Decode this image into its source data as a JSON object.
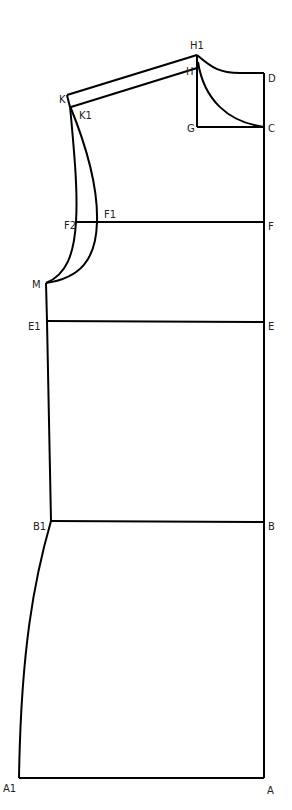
{
  "diagram": {
    "type": "sewing-pattern-draft",
    "stroke_color": "#000000",
    "label_color": "#222222",
    "background": "#ffffff",
    "points": {
      "H1": {
        "label": "H1",
        "x": 197,
        "y": 55
      },
      "H": {
        "label": "H",
        "x": 197,
        "y": 70
      },
      "D": {
        "label": "D",
        "x": 264,
        "y": 73
      },
      "G": {
        "label": "G",
        "x": 197,
        "y": 127
      },
      "C": {
        "label": "C",
        "x": 264,
        "y": 127
      },
      "K": {
        "label": "K",
        "x": 67,
        "y": 95
      },
      "K1": {
        "label": "K1",
        "x": 71,
        "y": 107
      },
      "F2": {
        "label": "F2",
        "x": 75,
        "y": 222
      },
      "F1": {
        "label": "F1",
        "x": 98,
        "y": 222
      },
      "F": {
        "label": "F",
        "x": 264,
        "y": 222
      },
      "M": {
        "label": "M",
        "x": 46,
        "y": 283
      },
      "E1": {
        "label": "E1",
        "x": 47,
        "y": 321
      },
      "E": {
        "label": "E",
        "x": 264,
        "y": 322
      },
      "B1": {
        "label": "B1",
        "x": 51,
        "y": 521
      },
      "B": {
        "label": "B",
        "x": 264,
        "y": 522
      },
      "A1": {
        "label": "A1",
        "x": 19,
        "y": 778
      },
      "A": {
        "label": "A",
        "x": 264,
        "y": 778
      }
    }
  }
}
